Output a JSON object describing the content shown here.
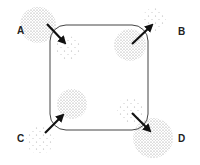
{
  "diagram": {
    "labels": {
      "A": "A",
      "B": "B",
      "C": "C",
      "D": "D"
    },
    "colors": {
      "stroke": "#333333",
      "dots": "#777777",
      "arrow": "#111111"
    }
  }
}
